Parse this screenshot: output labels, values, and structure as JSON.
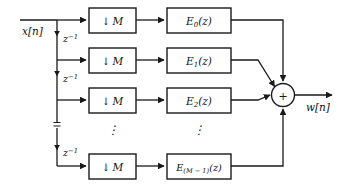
{
  "figure": {
    "type": "block-diagram",
    "line_color": "#1a1a1a",
    "box_fill": "#ffffff",
    "background": "#ffffff"
  },
  "signals": {
    "input_label": "x[n]",
    "output_label": "w[n]"
  },
  "delay_line": {
    "element_label": "z",
    "element_exponent": "−1",
    "count": 4,
    "ellipsis": "⋮"
  },
  "branches": [
    {
      "index": 0,
      "downsampler": {
        "arrow": "↓",
        "factor": "M"
      },
      "filter": {
        "base": "E",
        "subscript": "0",
        "arg": "(z)"
      }
    },
    {
      "index": 1,
      "downsampler": {
        "arrow": "↓",
        "factor": "M"
      },
      "filter": {
        "base": "E",
        "subscript": "1",
        "arg": "(z)"
      }
    },
    {
      "index": 2,
      "downsampler": {
        "arrow": "↓",
        "factor": "M"
      },
      "filter": {
        "base": "E",
        "subscript": "2",
        "arg": "(z)"
      }
    },
    {
      "index": 3,
      "downsampler": {
        "arrow": "↓",
        "factor": "M"
      },
      "filter": {
        "base": "E",
        "subscript": "(M − 1)",
        "arg": "(z)"
      }
    }
  ],
  "ellipsis": {
    "downsampler_column": "⋮",
    "filter_column": "⋮",
    "delay_column": "⋮"
  },
  "adder": {
    "sign": "+",
    "input_count": 4
  }
}
